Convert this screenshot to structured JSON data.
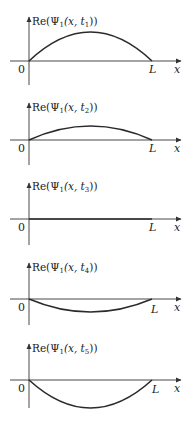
{
  "figure": {
    "x_axis_label": "x",
    "origin_label": "0",
    "right_endpoint_label": "L",
    "panels": [
      {
        "id": "t1",
        "label": "Re(Ψ₁(x, t₁))",
        "label_parts": {
          "prefix": "Re(Ψ",
          "sub1": "1",
          "mid": "(x, t",
          "sub2": "1",
          "suffix": "))"
        },
        "amplitude": 1.0
      },
      {
        "id": "t2",
        "label": "Re(Ψ₁(x, t₂))",
        "label_parts": {
          "prefix": "Re(Ψ",
          "sub1": "1",
          "mid": "(x, t",
          "sub2": "2",
          "suffix": "))"
        },
        "amplitude": 0.5
      },
      {
        "id": "t3",
        "label": "Re(Ψ₁(x, t₃))",
        "label_parts": {
          "prefix": "Re(Ψ",
          "sub1": "1",
          "mid": "(x, t",
          "sub2": "3",
          "suffix": "))"
        },
        "amplitude": 0.0
      },
      {
        "id": "t4",
        "label": "Re(Ψ₁(x, t₄))",
        "label_parts": {
          "prefix": "Re(Ψ",
          "sub1": "1",
          "mid": "(x, t",
          "sub2": "4",
          "suffix": "))"
        },
        "amplitude": -0.45
      },
      {
        "id": "t5",
        "label": "Re(Ψ₁(x, t₅))",
        "label_parts": {
          "prefix": "Re(Ψ",
          "sub1": "1",
          "mid": "(x, t",
          "sub2": "5",
          "suffix": "))"
        },
        "amplitude": -0.97
      }
    ],
    "colors": {
      "axis": "#333333",
      "curve": "#2a2a2a",
      "text": "#1a1a1a",
      "background": "#ffffff"
    }
  }
}
